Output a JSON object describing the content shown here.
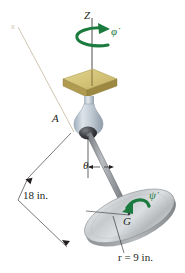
{
  "figure": {
    "type": "engineering-mechanics-diagram",
    "labels": {
      "z_axis": "Z",
      "x_axis": "x",
      "precession_rate": "φ̇",
      "pivot_point": "A",
      "nutation_angle": "θ",
      "rod_length": "18 in.",
      "spin_rate": "ψ̇",
      "mass_center": "G",
      "disk_radius": "r = 9 in."
    },
    "colors": {
      "plate_top": "#d8c87f",
      "plate_front": "#b8a354",
      "plate_side": "#9c8840",
      "joint_body": "#c3cdd6",
      "joint_ball": "#3a3a3c",
      "rod": "#8d9095",
      "disk_top": "#c9ccce",
      "disk_rim": "#9a9da0",
      "arrow_green": "#1b7a3d",
      "line_black": "#231f20",
      "axis_faint": "#cbbfa8"
    }
  }
}
